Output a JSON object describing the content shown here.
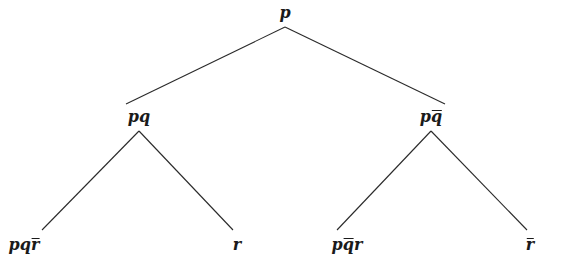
{
  "diagram": {
    "type": "tree",
    "line_color": "#2a2a2a",
    "nodes": [
      {
        "id": "root",
        "parts": [
          {
            "t": "p",
            "bar": false
          }
        ],
        "label": "p",
        "x": 285,
        "y": 13
      },
      {
        "id": "left",
        "parts": [
          {
            "t": "p",
            "bar": false
          },
          {
            "t": "q",
            "bar": false
          }
        ],
        "label": "pq",
        "x": 139,
        "y": 117
      },
      {
        "id": "right",
        "parts": [
          {
            "t": "p",
            "bar": false
          },
          {
            "t": "q",
            "bar": true
          }
        ],
        "label": "pq̄",
        "x": 431,
        "y": 117
      },
      {
        "id": "ll",
        "parts": [
          {
            "t": "p",
            "bar": false
          },
          {
            "t": "q",
            "bar": false
          },
          {
            "t": "r",
            "bar": true
          }
        ],
        "label": "pqr̄",
        "x": 24,
        "y": 245
      },
      {
        "id": "lr",
        "parts": [
          {
            "t": "r",
            "bar": false
          }
        ],
        "label": "r",
        "x": 237,
        "y": 245
      },
      {
        "id": "rl",
        "parts": [
          {
            "t": "p",
            "bar": false
          },
          {
            "t": "q",
            "bar": true
          },
          {
            "t": "r",
            "bar": false
          }
        ],
        "label": "pq̄r",
        "x": 347,
        "y": 245
      },
      {
        "id": "rr",
        "parts": [
          {
            "t": "r",
            "bar": true
          }
        ],
        "label": "r̄",
        "x": 530,
        "y": 245
      }
    ],
    "edges": [
      {
        "from": "root",
        "to": "left",
        "x1": 285,
        "y1": 27,
        "x2": 126,
        "y2": 104
      },
      {
        "from": "root",
        "to": "right",
        "x1": 285,
        "y1": 27,
        "x2": 445,
        "y2": 104
      },
      {
        "from": "left",
        "to": "ll",
        "x1": 139,
        "y1": 131,
        "x2": 42,
        "y2": 230
      },
      {
        "from": "left",
        "to": "lr",
        "x1": 139,
        "y1": 131,
        "x2": 233,
        "y2": 230
      },
      {
        "from": "right",
        "to": "rl",
        "x1": 431,
        "y1": 131,
        "x2": 337,
        "y2": 230
      },
      {
        "from": "right",
        "to": "rr",
        "x1": 431,
        "y1": 131,
        "x2": 527,
        "y2": 230
      }
    ]
  }
}
